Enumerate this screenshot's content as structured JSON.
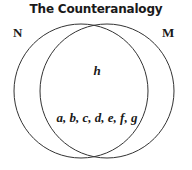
{
  "title": "The Counteranalogy",
  "sets": [
    {
      "id": "N",
      "label": "N"
    },
    {
      "id": "M",
      "label": "M"
    }
  ],
  "regions": {
    "upper_intersection": "h",
    "lower_intersection": "a, b, c, d, e, f, g"
  },
  "colors": {
    "stroke": "#333333",
    "text": "#1a1a1a",
    "background": "#ffffff"
  }
}
